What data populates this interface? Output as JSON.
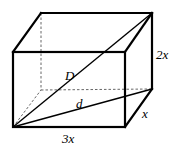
{
  "diagram": {
    "type": "rectangular-prism",
    "labels": {
      "space_diagonal": "D",
      "base_diagonal": "d",
      "length": "3x",
      "height": "2x",
      "depth": "x"
    },
    "vertices": {
      "front_top_left": [
        13,
        52
      ],
      "front_top_right": [
        125,
        52
      ],
      "front_bottom_left": [
        13,
        127
      ],
      "front_bottom_right": [
        125,
        127
      ],
      "back_top_left": [
        41,
        13
      ],
      "back_top_right": [
        152,
        13
      ],
      "back_bottom_left": [
        41,
        90
      ],
      "back_bottom_right": [
        152,
        89
      ]
    },
    "colors": {
      "stroke": "#000000",
      "hidden_stroke": "#555555",
      "background": "#ffffff"
    }
  }
}
